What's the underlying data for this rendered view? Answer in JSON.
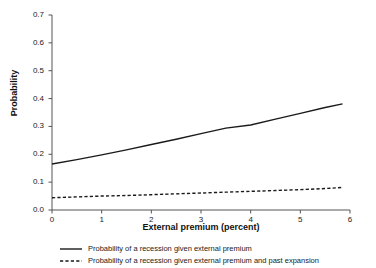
{
  "chart_data": {
    "type": "line",
    "title": "",
    "xlabel": "External premium (percent)",
    "ylabel": "Probability",
    "xlim": [
      0,
      6
    ],
    "ylim": [
      0.0,
      0.7
    ],
    "xticks": [
      "0",
      "1",
      "2",
      "3",
      "4",
      "5",
      "6"
    ],
    "yticks": [
      "0.0",
      "0.1",
      "0.2",
      "0.3",
      "0.4",
      "0.5",
      "0.6",
      "0.7"
    ],
    "grid": false,
    "legend_position": "below",
    "x": [
      0,
      0.5,
      1,
      1.5,
      2,
      2.5,
      3,
      3.5,
      4,
      4.5,
      5,
      5.5,
      5.85
    ],
    "series": [
      {
        "name": "Probability of a recession given external premium",
        "style": "solid",
        "color": "#1a1a1a",
        "values": [
          0.165,
          0.181,
          0.198,
          0.216,
          0.235,
          0.254,
          0.274,
          0.294,
          0.305,
          0.326,
          0.347,
          0.368,
          0.381
        ]
      },
      {
        "name": "Probability of a recession given external premium and past expansion",
        "style": "dashed",
        "color": "#1a1a1a",
        "values": [
          0.044,
          0.047,
          0.05,
          0.052,
          0.055,
          0.058,
          0.061,
          0.064,
          0.067,
          0.07,
          0.073,
          0.077,
          0.081
        ]
      }
    ]
  },
  "axes": {
    "spine_color": "#555555",
    "tick_color": "#555555"
  },
  "legend": {
    "entries": [
      {
        "label": "Probability of a recession given external premium",
        "style": "solid"
      },
      {
        "label": "Probability of a recession given external premium and past expansion",
        "style": "dashed"
      }
    ]
  }
}
